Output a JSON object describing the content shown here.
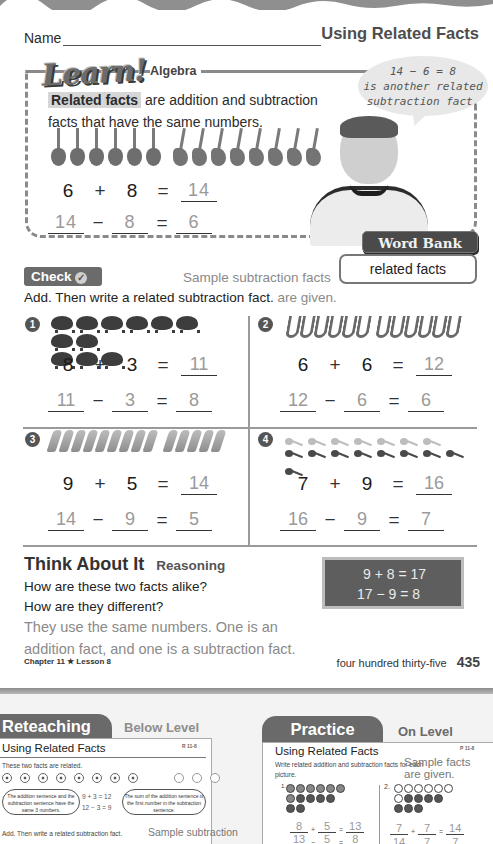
{
  "header": {
    "name_label": "Name",
    "lesson_title": "Using Related Facts"
  },
  "learn": {
    "logo": "Learn!",
    "subtitle": "Algebra",
    "term": "Related facts",
    "definition_rest": " are addition and subtraction facts that have the same numbers.",
    "speech_bubble": [
      "14 − 6 = 8",
      "is another related",
      "subtraction fact."
    ],
    "guitars": {
      "group_a": 6,
      "group_b": 8
    },
    "addition": {
      "a": "6",
      "op": "+",
      "b": "8",
      "eq": "=",
      "result": "14"
    },
    "subtraction": {
      "a": "14",
      "op": "−",
      "b": "8",
      "eq": "=",
      "result": "6"
    }
  },
  "word_bank": {
    "label": "Word Bank",
    "terms": [
      "related facts"
    ]
  },
  "check": {
    "label": "Check",
    "instructions": "Add. Then write a related subtraction fact.",
    "teacher_note": [
      "Sample subtraction facts",
      "are given."
    ],
    "problems": [
      {
        "number": "1",
        "picture": "pigs",
        "count": 11,
        "addition": {
          "a": "8",
          "op": "+",
          "b": "3",
          "eq": "=",
          "result": "11"
        },
        "subtraction": {
          "a": "11",
          "op": "−",
          "b": "3",
          "eq": "=",
          "result": "8"
        }
      },
      {
        "number": "2",
        "picture": "saxophones",
        "count": 12,
        "addition": {
          "a": "6",
          "op": "+",
          "b": "6",
          "eq": "=",
          "result": "12"
        },
        "subtraction": {
          "a": "12",
          "op": "−",
          "b": "6",
          "eq": "=",
          "result": "6"
        }
      },
      {
        "number": "3",
        "picture": "paintbrushes",
        "count": 14,
        "addition": {
          "a": "9",
          "op": "+",
          "b": "5",
          "eq": "=",
          "result": "14"
        },
        "subtraction": {
          "a": "14",
          "op": "−",
          "b": "9",
          "eq": "=",
          "result": "5"
        }
      },
      {
        "number": "4",
        "picture": "spoons",
        "count": 16,
        "addition": {
          "a": "7",
          "op": "+",
          "b": "9",
          "eq": "=",
          "result": "16"
        },
        "subtraction": {
          "a": "16",
          "op": "−",
          "b": "9",
          "eq": "=",
          "result": "7"
        }
      }
    ]
  },
  "think": {
    "title": "Think About It",
    "subtitle": "Reasoning",
    "question_1": "How are these two facts alike?",
    "question_2": "How are they different?",
    "answer": "They use the same numbers. One is an addition fact, and one is a subtraction fact.",
    "chalkboard": [
      "9 + 8 = 17",
      "17 − 9 = 8"
    ]
  },
  "footer": {
    "chapter": "Chapter 11 ★ Lesson 8",
    "page_words": "four hundred thirty-five",
    "page_number": "435"
  },
  "reteaching": {
    "tab": "Reteaching",
    "level": "Below Level",
    "title": "Using Related Facts",
    "code": "R 11-8",
    "intro": "These two facts are related.",
    "cloud_left": "The addition sentence and the subtraction sentence have the same 3 numbers.",
    "facts": [
      "9 + 3 = 12",
      "12 − 3 = 9"
    ],
    "cloud_right": "The sum of the addition sentence is the first number in the subtraction sentence.",
    "instruction": "Add. Then write a related subtraction fact.",
    "sample_note": "Sample subtraction"
  },
  "practice": {
    "tab": "Practice",
    "level": "On Level",
    "title": "Using Related Facts",
    "code": "P 11-8",
    "instruction": "Write related addition and subtraction facts for each picture.",
    "sample_note": [
      "Sample facts",
      "are given."
    ],
    "problems": [
      {
        "number": "1.",
        "addition": [
          "8",
          "+",
          "5",
          "=",
          "13"
        ],
        "subtraction": [
          "13",
          "−",
          "5",
          "=",
          "8"
        ]
      },
      {
        "number": "2.",
        "addition": [
          "7",
          "+",
          "7",
          "=",
          "14"
        ],
        "subtraction": [
          "14",
          "−",
          "7",
          "=",
          "7"
        ]
      }
    ]
  }
}
